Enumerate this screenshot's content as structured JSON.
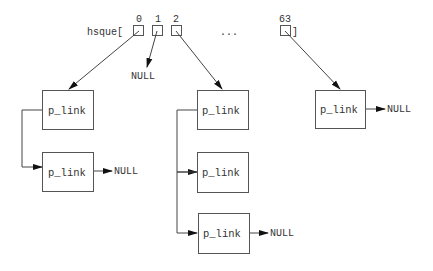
{
  "array": {
    "name": "hsque[",
    "close": "]",
    "indices": [
      {
        "label": "0",
        "x": 139
      },
      {
        "label": "1",
        "x": 158
      },
      {
        "label": "2",
        "x": 176
      },
      {
        "label": "63",
        "x": 285
      }
    ],
    "ellipsis": "..."
  },
  "null_label": "NULL",
  "node_label": "p_link",
  "labels": {
    "null_index1": "NULL",
    "null_left": "NULL",
    "null_middle": "NULL",
    "null_right": "NULL",
    "left_node1": "p_link",
    "left_node2": "p_link",
    "mid_node1": "p_link",
    "mid_node2": "p_link",
    "mid_node3": "p_link",
    "right_node1": "p_link"
  },
  "colors": {
    "line": "#444444",
    "box_stroke": "#555555",
    "text": "#333333",
    "background": "#ffffff"
  }
}
